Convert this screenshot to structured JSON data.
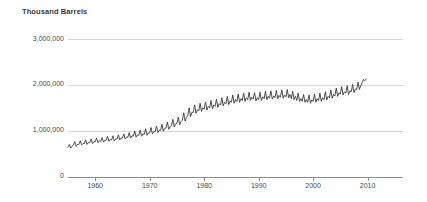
{
  "chart_data": {
    "type": "line",
    "title": "Thousand Barrels",
    "xlabel": "",
    "ylabel": "Thousand Barrels",
    "grid": true,
    "legend": "none",
    "series_color": "#3b3b3b",
    "grid_color": "#d6d6d6",
    "axis_color": "#8d8d8d",
    "xlim": [
      1955.0,
      2016.5
    ],
    "ylim": [
      0,
      3200000
    ],
    "ytick_labels": [
      "3,000,000",
      "2,000,000",
      "1,000,000",
      "0"
    ],
    "ytick_values": [
      3000000,
      2000000,
      1000000,
      0
    ],
    "xtick_labels": [
      "1960",
      "1970",
      "1980",
      "1990",
      "2000",
      "2010"
    ],
    "xtick_values": [
      1960,
      1970,
      1980,
      1990,
      2000,
      2010
    ],
    "x_start": 1955.0,
    "x_step": 0.25,
    "values": [
      640000,
      700000,
      620000,
      660000,
      690000,
      760000,
      660000,
      700000,
      700000,
      780000,
      690000,
      720000,
      720000,
      800000,
      700000,
      740000,
      740000,
      820000,
      720000,
      760000,
      760000,
      840000,
      740000,
      780000,
      770000,
      850000,
      750000,
      790000,
      790000,
      880000,
      770000,
      810000,
      800000,
      890000,
      780000,
      820000,
      820000,
      910000,
      800000,
      840000,
      840000,
      930000,
      820000,
      860000,
      860000,
      960000,
      840000,
      890000,
      880000,
      990000,
      860000,
      910000,
      900000,
      1010000,
      880000,
      930000,
      920000,
      1040000,
      900000,
      950000,
      950000,
      1070000,
      930000,
      980000,
      980000,
      1100000,
      960000,
      1010000,
      1010000,
      1140000,
      990000,
      1050000,
      1060000,
      1190000,
      1030000,
      1090000,
      1110000,
      1250000,
      1080000,
      1150000,
      1160000,
      1300000,
      1130000,
      1200000,
      1230000,
      1390000,
      1210000,
      1290000,
      1330000,
      1500000,
      1310000,
      1400000,
      1400000,
      1560000,
      1380000,
      1460000,
      1430000,
      1600000,
      1420000,
      1500000,
      1470000,
      1630000,
      1450000,
      1530000,
      1500000,
      1660000,
      1480000,
      1560000,
      1530000,
      1690000,
      1510000,
      1590000,
      1560000,
      1720000,
      1540000,
      1620000,
      1590000,
      1750000,
      1570000,
      1650000,
      1620000,
      1780000,
      1600000,
      1680000,
      1640000,
      1800000,
      1620000,
      1700000,
      1660000,
      1820000,
      1640000,
      1720000,
      1680000,
      1840000,
      1660000,
      1730000,
      1690000,
      1830000,
      1650000,
      1720000,
      1680000,
      1840000,
      1660000,
      1740000,
      1700000,
      1860000,
      1680000,
      1750000,
      1710000,
      1870000,
      1690000,
      1760000,
      1720000,
      1880000,
      1700000,
      1770000,
      1730000,
      1890000,
      1710000,
      1780000,
      1740000,
      1900000,
      1720000,
      1790000,
      1700000,
      1860000,
      1680000,
      1750000,
      1660000,
      1820000,
      1640000,
      1700000,
      1640000,
      1790000,
      1620000,
      1680000,
      1620000,
      1780000,
      1600000,
      1670000,
      1640000,
      1800000,
      1620000,
      1700000,
      1660000,
      1820000,
      1640000,
      1720000,
      1680000,
      1850000,
      1670000,
      1750000,
      1720000,
      1890000,
      1710000,
      1790000,
      1760000,
      1930000,
      1750000,
      1830000,
      1800000,
      1960000,
      1780000,
      1850000,
      1820000,
      1980000,
      1790000,
      1870000,
      1850000,
      2010000,
      1830000,
      1910000,
      1900000,
      2060000,
      1900000,
      1990000,
      2050000,
      2120000,
      2090000,
      2130000
    ]
  }
}
